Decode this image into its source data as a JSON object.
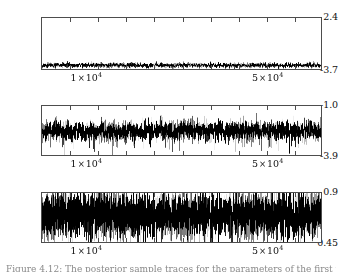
{
  "figure": {
    "background_color": "#ffffff",
    "frame_color": "#4d4d4d",
    "trace_color": "#000000",
    "caption_partial": "Figure 4.12: The posterior sample traces for the parameters of the first three chains"
  },
  "chart_data": [
    {
      "type": "line",
      "name": "trace-panel-1",
      "title": "",
      "xlabel": "",
      "ylabel": "",
      "xlim": [
        0,
        62000
      ],
      "ylim": [
        -3.7,
        2.4
      ],
      "ytick_labels": [
        "2.4",
        "-3.7"
      ],
      "ytick_values": [
        2.4,
        -3.7
      ],
      "xtick_labels": [
        "1 × 10",
        "5 × 10"
      ],
      "xtick_exponents": [
        "4",
        "4"
      ],
      "xtick_values": [
        10000,
        50000
      ],
      "grid": false,
      "legend": "none",
      "series_mean": -3.25,
      "series_sd": 0.14,
      "series_band_low": -3.66,
      "series_band_high": -2.92,
      "n_points": 62000
    },
    {
      "type": "line",
      "name": "trace-panel-2",
      "title": "",
      "xlabel": "",
      "ylabel": "",
      "xlim": [
        0,
        62000
      ],
      "ylim": [
        -3.9,
        -1.0
      ],
      "ytick_labels": [
        "-1.0",
        "-3.9"
      ],
      "ytick_values": [
        -1.0,
        -3.9
      ],
      "xtick_labels": [
        "1 × 10",
        "5 × 10"
      ],
      "xtick_exponents": [
        "4",
        "4"
      ],
      "xtick_values": [
        10000,
        50000
      ],
      "grid": false,
      "legend": "none",
      "series_mean": -2.45,
      "series_sd": 0.26,
      "series_band_low": -3.6,
      "series_band_high": -1.5,
      "n_points": 62000
    },
    {
      "type": "line",
      "name": "trace-panel-3",
      "title": "",
      "xlabel": "",
      "ylabel": "",
      "xlim": [
        0,
        62000
      ],
      "ylim": [
        0.45,
        0.9
      ],
      "ytick_labels": [
        "0.9",
        "0.45"
      ],
      "ytick_values": [
        0.9,
        0.45
      ],
      "xtick_labels": [
        "1 × 10",
        "5 × 10"
      ],
      "xtick_exponents": [
        "4",
        "4"
      ],
      "xtick_values": [
        10000,
        50000
      ],
      "grid": false,
      "legend": "none",
      "series_mean": 0.7,
      "series_sd": 0.1,
      "series_band_low": 0.45,
      "series_band_high": 0.9,
      "n_points": 62000
    }
  ],
  "panels": [
    {
      "id": "panel-1",
      "y_top_label": "2.4",
      "y_bottom_label": "-3.7",
      "x_labels": [
        {
          "mantissa": "1",
          "base": "10",
          "exp": "4"
        },
        {
          "mantissa": "5",
          "base": "10",
          "exp": "4"
        }
      ]
    },
    {
      "id": "panel-2",
      "y_top_label": "-1.0",
      "y_bottom_label": "-3.9",
      "x_labels": [
        {
          "mantissa": "1",
          "base": "10",
          "exp": "4"
        },
        {
          "mantissa": "5",
          "base": "10",
          "exp": "4"
        }
      ]
    },
    {
      "id": "panel-3",
      "y_top_label": "0.9",
      "y_bottom_label": "0.45",
      "x_labels": [
        {
          "mantissa": "1",
          "base": "10",
          "exp": "4"
        },
        {
          "mantissa": "5",
          "base": "10",
          "exp": "4"
        }
      ]
    }
  ]
}
